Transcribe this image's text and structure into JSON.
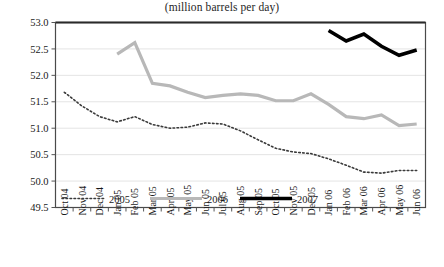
{
  "chart_data": {
    "type": "line",
    "title": "(million barrels per day)",
    "xlabel": "",
    "ylabel": "",
    "ylim": [
      49.5,
      53.0
    ],
    "ytick_step": 0.5,
    "yticks": [
      "49.5",
      "50.0",
      "50.5",
      "51.0",
      "51.5",
      "52.0",
      "52.5",
      "53.0"
    ],
    "grid": "horizontal",
    "legend_position": "bottom-inside",
    "categories": [
      "Oct 04",
      "Nov 04",
      "Dec 04",
      "Jan 05",
      "Feb 05",
      "Mar 05",
      "Apr 05",
      "May 05",
      "Jun 05",
      "Jul 05",
      "Aug 05",
      "Sep 05",
      "Oct 05",
      "Nov 05",
      "Dec 05",
      "Jan 06",
      "Feb 06",
      "Mar 06",
      "Apr 06",
      "May 06",
      "Jun 06"
    ],
    "series": [
      {
        "name": "2005",
        "style": "dotted",
        "color": "#3a3a3a",
        "width": 1.6,
        "values": [
          51.68,
          51.42,
          51.22,
          51.12,
          51.22,
          51.07,
          51.0,
          51.02,
          51.1,
          51.08,
          50.95,
          50.78,
          50.62,
          50.55,
          50.52,
          50.42,
          50.3,
          50.17,
          50.15,
          50.2,
          50.2
        ]
      },
      {
        "name": "2006",
        "style": "solid",
        "color": "#b8b8b8",
        "width": 3.2,
        "values": [
          null,
          null,
          null,
          52.4,
          52.62,
          51.85,
          51.8,
          51.68,
          51.58,
          51.62,
          51.65,
          51.62,
          51.52,
          51.52,
          51.65,
          51.45,
          51.22,
          51.18,
          51.25,
          51.05,
          51.08
        ]
      },
      {
        "name": "2007",
        "style": "solid",
        "color": "#000000",
        "width": 3.6,
        "values": [
          null,
          null,
          null,
          null,
          null,
          null,
          null,
          null,
          null,
          null,
          null,
          null,
          null,
          null,
          null,
          52.85,
          52.65,
          52.78,
          52.55,
          52.38,
          52.48
        ]
      }
    ]
  },
  "legend": {
    "items": [
      {
        "label": "2005"
      },
      {
        "label": "2006"
      },
      {
        "label": "2007"
      }
    ]
  }
}
